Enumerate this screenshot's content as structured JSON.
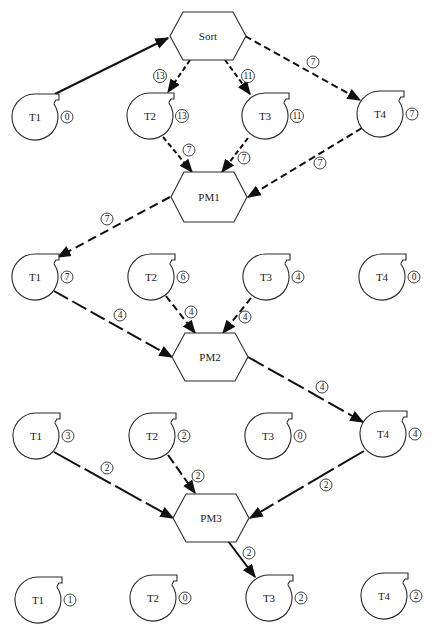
{
  "diagram": {
    "colors": {
      "ink": "#111111",
      "shape_stroke": "#2a2a2a",
      "background": "#ffffff"
    },
    "processes": [
      {
        "id": "sort",
        "label": "Sort",
        "cx": 208,
        "cy": 36,
        "hw": 38,
        "tw": 25,
        "hh": 24
      },
      {
        "id": "pm1",
        "label": "PM1",
        "cx": 209,
        "cy": 197,
        "hw": 38,
        "tw": 25,
        "hh": 25
      },
      {
        "id": "pm2",
        "label": "PM2",
        "cx": 210,
        "cy": 357,
        "hw": 38,
        "tw": 25,
        "hh": 24
      },
      {
        "id": "pm3",
        "label": "PM3",
        "cx": 211,
        "cy": 518,
        "hw": 38,
        "tw": 25,
        "hh": 24
      }
    ],
    "rows": [
      {
        "stage": "initial",
        "tapes": [
          {
            "id": "r0t1",
            "label": "T1",
            "count": "0",
            "cx": 35,
            "cy": 117
          },
          {
            "id": "r0t2",
            "label": "T2",
            "count": "13",
            "cx": 150,
            "cy": 116
          },
          {
            "id": "r0t3",
            "label": "T3",
            "count": "11",
            "cx": 265,
            "cy": 116
          },
          {
            "id": "r0t4",
            "label": "T4",
            "count": "7",
            "cx": 380,
            "cy": 114
          }
        ]
      },
      {
        "stage": "after-pm1",
        "tapes": [
          {
            "id": "r1t1",
            "label": "T1",
            "count": "7",
            "cx": 35,
            "cy": 277
          },
          {
            "id": "r1t2",
            "label": "T2",
            "count": "6",
            "cx": 151,
            "cy": 277
          },
          {
            "id": "r1t3",
            "label": "T3",
            "count": "4",
            "cx": 266,
            "cy": 277
          },
          {
            "id": "r1t4",
            "label": "T4",
            "count": "0",
            "cx": 382,
            "cy": 277
          }
        ]
      },
      {
        "stage": "after-pm2",
        "tapes": [
          {
            "id": "r2t1",
            "label": "T1",
            "count": "3",
            "cx": 36,
            "cy": 436
          },
          {
            "id": "r2t2",
            "label": "T2",
            "count": "2",
            "cx": 152,
            "cy": 436
          },
          {
            "id": "r2t3",
            "label": "T3",
            "count": "0",
            "cx": 268,
            "cy": 436
          },
          {
            "id": "r2t4",
            "label": "T4",
            "count": "4",
            "cx": 383,
            "cy": 434
          }
        ]
      },
      {
        "stage": "after-pm3",
        "tapes": [
          {
            "id": "r3t1",
            "label": "T1",
            "count": "1",
            "cx": 38,
            "cy": 600
          },
          {
            "id": "r3t2",
            "label": "T2",
            "count": "0",
            "cx": 153,
            "cy": 598
          },
          {
            "id": "r3t3",
            "label": "T3",
            "count": "2",
            "cx": 269,
            "cy": 598
          },
          {
            "id": "r3t4",
            "label": "T4",
            "count": "2",
            "cx": 384,
            "cy": 596
          }
        ]
      }
    ],
    "edges": [
      {
        "from": "T1",
        "to": "Sort",
        "label": "",
        "x1": 55,
        "y1": 94,
        "x2": 168,
        "y2": 38,
        "dash": "",
        "lx": 0,
        "ly": 0
      },
      {
        "from": "Sort",
        "to": "T2",
        "label": "13",
        "x1": 190,
        "y1": 60,
        "x2": 168,
        "y2": 92,
        "dash": "5 3",
        "lx": 160,
        "ly": 76
      },
      {
        "from": "Sort",
        "to": "T3",
        "label": "11",
        "x1": 225,
        "y1": 60,
        "x2": 250,
        "y2": 94,
        "dash": "5 3",
        "lx": 248,
        "ly": 76
      },
      {
        "from": "Sort",
        "to": "T4",
        "label": "7",
        "x1": 245,
        "y1": 36,
        "x2": 360,
        "y2": 100,
        "dash": "7 4",
        "lx": 313,
        "ly": 62
      },
      {
        "from": "T2",
        "to": "PM1",
        "label": "7",
        "x1": 163,
        "y1": 137,
        "x2": 192,
        "y2": 172,
        "dash": "5 3",
        "lx": 189,
        "ly": 150
      },
      {
        "from": "T3",
        "to": "PM1",
        "label": "7",
        "x1": 248,
        "y1": 138,
        "x2": 222,
        "y2": 172,
        "dash": "5 3",
        "lx": 244,
        "ly": 158
      },
      {
        "from": "T4",
        "to": "PM1",
        "label": "7",
        "x1": 362,
        "y1": 128,
        "x2": 248,
        "y2": 197,
        "dash": "7 4",
        "lx": 320,
        "ly": 163
      },
      {
        "from": "PM1",
        "to": "T1",
        "label": "7",
        "x1": 170,
        "y1": 197,
        "x2": 58,
        "y2": 257,
        "dash": "9 5",
        "lx": 107,
        "ly": 219
      },
      {
        "from": "T1",
        "to": "PM2",
        "label": "4",
        "x1": 54,
        "y1": 291,
        "x2": 172,
        "y2": 357,
        "dash": "16 5",
        "lx": 120,
        "ly": 315
      },
      {
        "from": "T2",
        "to": "PM2",
        "label": "4",
        "x1": 166,
        "y1": 296,
        "x2": 195,
        "y2": 333,
        "dash": "7 4",
        "lx": 191,
        "ly": 312
      },
      {
        "from": "T3",
        "to": "PM2",
        "label": "4",
        "x1": 251,
        "y1": 298,
        "x2": 223,
        "y2": 333,
        "dash": "7 4",
        "lx": 245,
        "ly": 317
      },
      {
        "from": "PM2",
        "to": "T4",
        "label": "4",
        "x1": 248,
        "y1": 357,
        "x2": 363,
        "y2": 422,
        "dash": "18 5",
        "lx": 322,
        "ly": 387
      },
      {
        "from": "T1",
        "to": "PM3",
        "label": "2",
        "x1": 54,
        "y1": 452,
        "x2": 173,
        "y2": 518,
        "dash": "30 5",
        "lx": 107,
        "ly": 468
      },
      {
        "from": "T2",
        "to": "PM3",
        "label": "2",
        "x1": 168,
        "y1": 455,
        "x2": 195,
        "y2": 493,
        "dash": "10 4",
        "lx": 198,
        "ly": 476
      },
      {
        "from": "T4",
        "to": "PM3",
        "label": "2",
        "x1": 364,
        "y1": 451,
        "x2": 250,
        "y2": 518,
        "dash": "30 5",
        "lx": 326,
        "ly": 485
      },
      {
        "from": "PM3",
        "to": "T3",
        "label": "2",
        "x1": 228,
        "y1": 541,
        "x2": 255,
        "y2": 577,
        "dash": "",
        "lx": 249,
        "ly": 553
      }
    ]
  }
}
